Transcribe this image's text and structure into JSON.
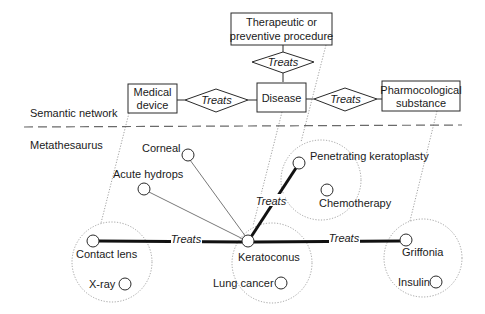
{
  "layers": {
    "semantic_network_label": "Semantic network",
    "metathesaurus_label": "Metathesaurus"
  },
  "semantic_network": {
    "types": {
      "therapeutic_line1": "Therapeutic or",
      "therapeutic_line2": "preventive procedure",
      "medical_device_line1": "Medical",
      "medical_device_line2": "device",
      "disease": "Disease",
      "pharmacological_line1": "Pharmocological",
      "pharmacological_line2": "substance"
    },
    "relations": {
      "top": "Treats",
      "left": "Treats",
      "right": "Treats"
    }
  },
  "metathesaurus": {
    "concepts": {
      "corneal": "Corneal",
      "acute_hydrops": "Acute hydrops",
      "penetrating_keratoplasty": "Penetrating keratoplasty",
      "chemotherapy": "Chemotherapy",
      "contact_lens": "Contact lens",
      "x_ray": "X-ray",
      "keratoconus": "Keratoconus",
      "lung_cancer": "Lung cancer",
      "griffonia": "Griffonia",
      "insulin": "Insulin"
    },
    "edges": {
      "penetrating_treats": "Treats",
      "contact_lens_treats": "Treats",
      "griffonia_treats": "Treats"
    }
  }
}
